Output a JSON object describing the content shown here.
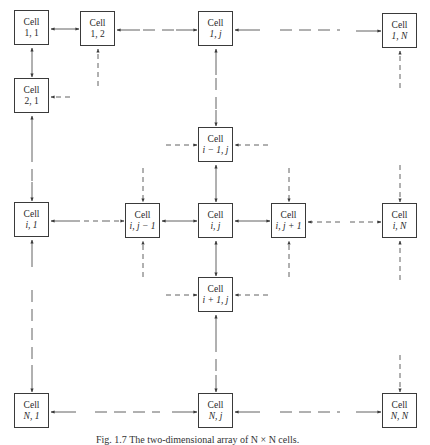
{
  "diagram": {
    "cell_label": "Cell",
    "cells": {
      "c11": {
        "label": "Cell",
        "index": "1, 1"
      },
      "c12": {
        "label": "Cell",
        "index": "1, 2"
      },
      "c1j": {
        "label": "Cell",
        "index": "1, j"
      },
      "c1N": {
        "label": "Cell",
        "index": "1, N"
      },
      "c21": {
        "label": "Cell",
        "index": "2, 1"
      },
      "cim1j": {
        "label": "Cell",
        "index": "i − 1, j"
      },
      "ci1": {
        "label": "Cell",
        "index": "i, 1"
      },
      "cijm1": {
        "label": "Cell",
        "index": "i, j − 1"
      },
      "cij": {
        "label": "Cell",
        "index": "i, j"
      },
      "cijp1": {
        "label": "Cell",
        "index": "i, j + 1"
      },
      "ciN": {
        "label": "Cell",
        "index": "i, N"
      },
      "cip1j": {
        "label": "Cell",
        "index": "i + 1, j"
      },
      "cN1": {
        "label": "Cell",
        "index": "N, 1"
      },
      "cNj": {
        "label": "Cell",
        "index": "N, j"
      },
      "cNN": {
        "label": "Cell",
        "index": "N, N"
      }
    },
    "caption": "Fig. 1.7 The two-dimensional array of N × N cells.",
    "colors": {
      "stroke": "#3a3a3a",
      "text": "#2a2a2a",
      "background": "#ffffff"
    }
  }
}
